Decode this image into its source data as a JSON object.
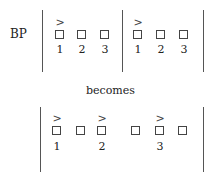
{
  "top": {
    "label": "BP",
    "groups": [
      {
        "boxes": [
          "1",
          "2",
          "3"
        ],
        "marked_index": 0
      },
      {
        "boxes": [
          "1",
          "2",
          "3"
        ],
        "marked_index": 0
      }
    ]
  },
  "transition_text": "becomes",
  "bottom": {
    "boxes": [
      {
        "label": "1",
        "marked": true
      },
      {
        "label": "",
        "marked": false
      },
      {
        "label": "2",
        "marked": true
      },
      {
        "label": "",
        "marked": false
      },
      {
        "label": "3",
        "marked": true
      },
      {
        "label": "",
        "marked": false
      }
    ]
  },
  "symbols": {
    "marker": ">"
  }
}
